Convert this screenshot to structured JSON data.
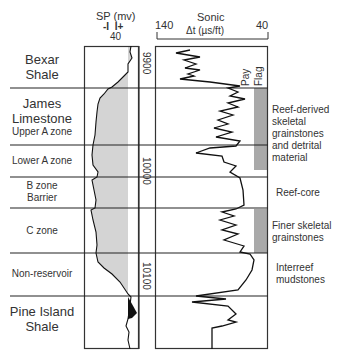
{
  "sp_header": {
    "title": "SP (mv)",
    "polarity": "-I  I+",
    "scale": "40"
  },
  "sonic_header": {
    "title": "Sonic",
    "unit": "Δt (µs/ft)",
    "left_scale": "140",
    "right_scale": "40"
  },
  "pay_flag_label": [
    "Pay",
    "Flag"
  ],
  "depth_ticks": [
    "9900",
    "10000",
    "10100"
  ],
  "zones": [
    {
      "name": "bexar-shale",
      "lines": [
        "Bexar",
        "Shale"
      ],
      "big": true
    },
    {
      "name": "james-limestone-upper-a",
      "lines": [
        "James",
        "Limestone",
        "Upper A zone"
      ],
      "big_lines": 2
    },
    {
      "name": "lower-a-zone",
      "lines": [
        "Lower A zone"
      ]
    },
    {
      "name": "b-zone-barrier",
      "lines": [
        "B zone",
        "Barrier"
      ]
    },
    {
      "name": "c-zone",
      "lines": [
        "C zone"
      ]
    },
    {
      "name": "non-reservoir",
      "lines": [
        "Non-reservoir"
      ]
    },
    {
      "name": "pine-island-shale",
      "lines": [
        "Pine Island",
        "Shale"
      ],
      "big": true
    }
  ],
  "descriptions": [
    {
      "name": "reef-derived",
      "lines": [
        "Reef-derived",
        "skeletal",
        "grainstones",
        "and detrital",
        "material"
      ]
    },
    {
      "name": "reef-core",
      "lines": [
        "Reef-core"
      ]
    },
    {
      "name": "finer-skeletal",
      "lines": [
        "Finer skeletal",
        "grainstones"
      ]
    },
    {
      "name": "interreef",
      "lines": [
        "Interreef",
        "mudstones"
      ]
    }
  ],
  "colors": {
    "line": "#222222",
    "sp_fill": "#d4d4d4",
    "pay_fill": "#a9a9a9",
    "sp_black": "#111111"
  }
}
